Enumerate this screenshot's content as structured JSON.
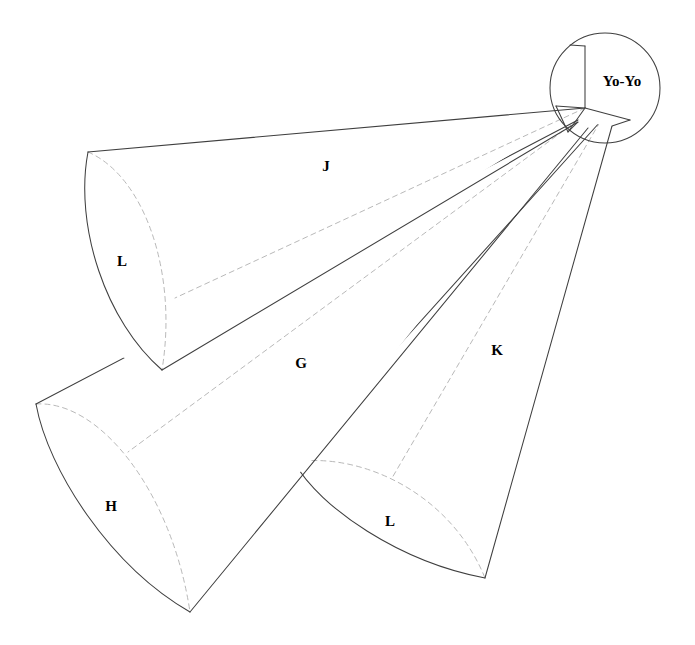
{
  "figure": {
    "kind": "3d-line-diagram",
    "title_label": "Yo-Yo",
    "background_color": "#ffffff",
    "line_color": "#3f3f3f",
    "hidden_line_color": "#b9b9b9",
    "label_color": "#000000",
    "canvas": {
      "width": 695,
      "height": 645
    },
    "apex": {
      "x": 585,
      "y": 108
    },
    "marker_circle": {
      "cx": 605,
      "cy": 88,
      "r": 55
    },
    "labels": [
      {
        "id": "label-j",
        "text": "J",
        "x": 326,
        "y": 168,
        "describes": "upper-left cone lateral surface"
      },
      {
        "id": "label-l-upper",
        "text": "L",
        "x": 122,
        "y": 263,
        "describes": "upper-left cone base disc"
      },
      {
        "id": "label-g",
        "text": "G",
        "x": 301,
        "y": 365,
        "describes": "lower-left cone lateral surface"
      },
      {
        "id": "label-h",
        "text": "H",
        "x": 111,
        "y": 508,
        "describes": "lower-left cone base disc"
      },
      {
        "id": "label-k",
        "text": "K",
        "x": 497,
        "y": 352,
        "describes": "right cone lateral surface"
      },
      {
        "id": "label-l-right",
        "text": "L",
        "x": 390,
        "y": 523,
        "describes": "right cone base disc"
      }
    ],
    "cones": [
      {
        "id": "cone-upper-left",
        "surface_label": "J",
        "base_label": "L",
        "apex": {
          "x": 585,
          "y": 108
        },
        "base_top": {
          "x": 88,
          "y": 152
        },
        "base_bottom": {
          "x": 162,
          "y": 370
        }
      },
      {
        "id": "cone-lower-left",
        "surface_label": "G",
        "base_label": "H",
        "apex": {
          "x": 578,
          "y": 120
        },
        "base_top": {
          "x": 36,
          "y": 404
        },
        "base_bottom": {
          "x": 190,
          "y": 612
        }
      },
      {
        "id": "cone-right",
        "surface_label": "K",
        "base_label": "L",
        "apex": {
          "x": 600,
          "y": 122
        },
        "base_top": {
          "x": 294,
          "y": 462
        },
        "base_bottom": {
          "x": 485,
          "y": 578
        }
      }
    ]
  }
}
